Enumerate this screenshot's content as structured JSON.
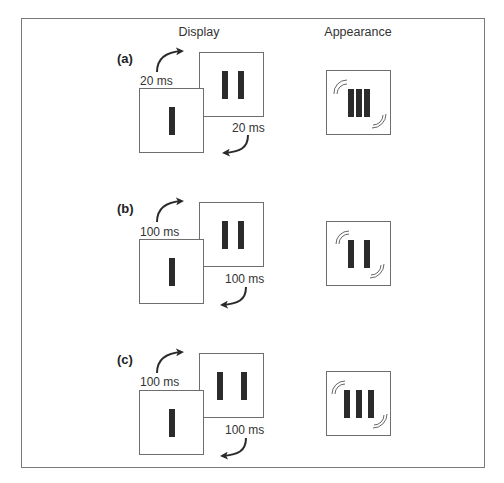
{
  "headers": {
    "display": "Display",
    "appearance": "Appearance"
  },
  "rows": [
    {
      "label": "(a)",
      "timing_top": "20 ms",
      "timing_bottom": "20 ms",
      "display_frame_1_bars": 1,
      "display_frame_2_bars": 2,
      "display_frame_2_spacing": "close",
      "appearance_bars": 3,
      "appearance_spacing": "adjacent"
    },
    {
      "label": "(b)",
      "timing_top": "100 ms",
      "timing_bottom": "100 ms",
      "display_frame_1_bars": 1,
      "display_frame_2_bars": 2,
      "display_frame_2_spacing": "close",
      "appearance_bars": 2,
      "appearance_spacing": "separated"
    },
    {
      "label": "(c)",
      "timing_top": "100 ms",
      "timing_bottom": "100 ms",
      "display_frame_1_bars": 1,
      "display_frame_2_bars": 2,
      "display_frame_2_spacing": "wide",
      "appearance_bars": 3,
      "appearance_spacing": "separated"
    }
  ],
  "colors": {
    "bar": "#2b2b2b",
    "frame_border": "#6e6e6e",
    "outer_border": "#7a7a7a",
    "background": "#ffffff"
  }
}
